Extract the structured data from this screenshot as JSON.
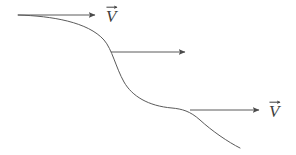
{
  "figure": {
    "background_color": "#ffffff",
    "stroke_color": "#555555",
    "text_color": "#3f3f3f",
    "width": 296,
    "height": 155
  },
  "curve": {
    "name": "streamline-curve",
    "description": "S-shaped descending streamline",
    "path": "M 18 15 C 52 16, 88 22, 104 40 C 112 49, 116 68, 124 82 C 132 96, 148 106, 172 108 C 182 109, 190 111, 200 120 C 212 131, 228 142, 240 148"
  },
  "arrows": [
    {
      "name": "velocity-arrow-top",
      "label": "V",
      "accent": "vector-arrow",
      "x1": 18,
      "y1": 15,
      "x2": 95,
      "y2": 15,
      "label_x": 106,
      "label_y": 5
    },
    {
      "name": "velocity-arrow-middle",
      "label": "",
      "accent": "",
      "x1": 111,
      "y1": 52,
      "x2": 185,
      "y2": 52,
      "label_x": 0,
      "label_y": 0
    },
    {
      "name": "velocity-arrow-bottom",
      "label": "V",
      "accent": "vector-arrow",
      "x1": 190,
      "y1": 110,
      "x2": 259,
      "y2": 110,
      "label_x": 269,
      "label_y": 100
    }
  ],
  "labels": {
    "top_vector": "V",
    "bottom_vector": "V"
  }
}
